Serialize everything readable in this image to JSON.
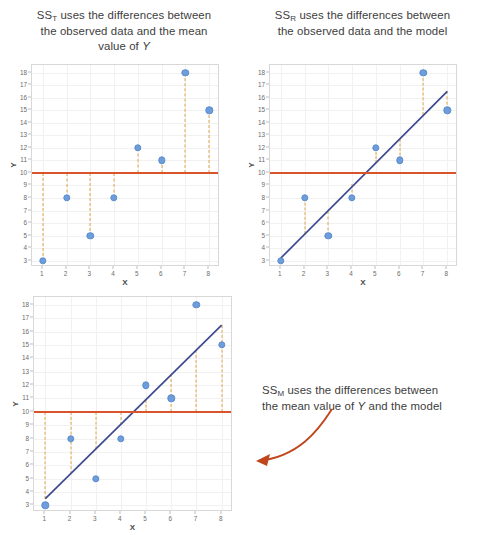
{
  "figure": {
    "title_t_prefix": "SS",
    "title_t_sub": "T",
    "title_t_line1_rest": " uses the differences between",
    "title_t_line2": "the observed data and the mean",
    "title_t_line3_a": "value of ",
    "title_t_line3_y": "Y",
    "title_r_prefix": "SS",
    "title_r_sub": "R",
    "title_r_line1_rest": " uses the differences between",
    "title_r_line2": "the observed data and the model",
    "title_m_prefix": "SS",
    "title_m_sub": "M",
    "title_m_line1_rest": " uses the differences between",
    "title_m_line2_a": "the mean value of ",
    "title_m_line2_y": "Y",
    "title_m_line2_b": " and the model"
  },
  "colors": {
    "point": "#6d9ddb",
    "mean_line": "#d9542b",
    "dashed": "#e0a44b",
    "model_line": "#3d4a8f",
    "arrow": "#c0461d",
    "grid": "#f1f1f1",
    "axis_text": "#6b6b6b"
  },
  "chart_data": [
    {
      "type": "scatter",
      "id": "ss-total",
      "title": "SS_T uses the differences between the observed data and the mean value of Y",
      "xlabel": "X",
      "ylabel": "Y",
      "x": [
        1,
        2,
        3,
        4,
        5,
        6,
        7,
        8
      ],
      "values": [
        3,
        8,
        5,
        8,
        12,
        11,
        18,
        15
      ],
      "xlim": [
        0.55,
        8.45
      ],
      "ylim": [
        2.5,
        18.6
      ],
      "xticks": [
        1,
        2,
        3,
        4,
        5,
        6,
        7,
        8
      ],
      "yticks": [
        3,
        4,
        5,
        6,
        7,
        8,
        9,
        10,
        11,
        12,
        13,
        14,
        15,
        16,
        17,
        18
      ],
      "grid": true,
      "legend": "none",
      "mean_line": 10,
      "model_line": null,
      "residual_type": "point-to-mean",
      "dashed_segments": [
        {
          "x": 1,
          "y1": 10,
          "y2": 3
        },
        {
          "x": 2,
          "y1": 10,
          "y2": 8
        },
        {
          "x": 3,
          "y1": 10,
          "y2": 5
        },
        {
          "x": 4,
          "y1": 10,
          "y2": 8
        },
        {
          "x": 5,
          "y1": 10,
          "y2": 12
        },
        {
          "x": 6,
          "y1": 10,
          "y2": 11
        },
        {
          "x": 7,
          "y1": 10,
          "y2": 18
        },
        {
          "x": 8,
          "y1": 10,
          "y2": 15
        }
      ]
    },
    {
      "type": "scatter",
      "id": "ss-residual",
      "title": "SS_R uses the differences between the observed data and the model",
      "xlabel": "X",
      "ylabel": "Y",
      "x": [
        1,
        2,
        3,
        4,
        5,
        6,
        7,
        8
      ],
      "values": [
        3,
        8,
        5,
        8,
        12,
        11,
        18,
        15
      ],
      "xlim": [
        0.55,
        8.45
      ],
      "ylim": [
        2.5,
        18.6
      ],
      "xticks": [
        1,
        2,
        3,
        4,
        5,
        6,
        7,
        8
      ],
      "yticks": [
        3,
        4,
        5,
        6,
        7,
        8,
        9,
        10,
        11,
        12,
        13,
        14,
        15,
        16,
        17,
        18
      ],
      "grid": true,
      "legend": "none",
      "mean_line": 10,
      "model_line": {
        "x1": 1,
        "y1": 3.2,
        "x2": 8,
        "y2": 16.5
      },
      "residual_type": "point-to-model",
      "dashed_segments": [
        {
          "x": 2,
          "y1": 8,
          "y2": 5.1
        },
        {
          "x": 3,
          "y1": 5,
          "y2": 7.0
        },
        {
          "x": 4,
          "y1": 8,
          "y2": 9.1
        },
        {
          "x": 5,
          "y1": 12,
          "y2": 10.8
        },
        {
          "x": 6,
          "y1": 11,
          "y2": 12.7
        },
        {
          "x": 7,
          "y1": 18,
          "y2": 14.6
        },
        {
          "x": 8,
          "y1": 15,
          "y2": 16.5
        }
      ]
    },
    {
      "type": "scatter",
      "id": "ss-model",
      "title": "SS_M uses the differences between the mean value of Y and the model",
      "xlabel": "X",
      "ylabel": "Y",
      "x": [
        1,
        2,
        3,
        4,
        5,
        6,
        7,
        8
      ],
      "values": [
        3,
        8,
        5,
        8,
        12,
        11,
        18,
        15
      ],
      "xlim": [
        0.55,
        8.45
      ],
      "ylim": [
        2.5,
        18.6
      ],
      "xticks": [
        1,
        2,
        3,
        4,
        5,
        6,
        7,
        8
      ],
      "yticks": [
        3,
        4,
        5,
        6,
        7,
        8,
        9,
        10,
        11,
        12,
        13,
        14,
        15,
        16,
        17,
        18
      ],
      "grid": true,
      "legend": "none",
      "mean_line": 10,
      "model_line": {
        "x1": 1,
        "y1": 3.5,
        "x2": 8,
        "y2": 16.5
      },
      "residual_type": "mean-to-model",
      "dashed_segments": [
        {
          "x": 1,
          "y1": 10,
          "y2": 3.5
        },
        {
          "x": 2,
          "y1": 10,
          "y2": 5.35
        },
        {
          "x": 3,
          "y1": 10,
          "y2": 7.2
        },
        {
          "x": 4,
          "y1": 10,
          "y2": 9.05
        },
        {
          "x": 5,
          "y1": 10,
          "y2": 10.9
        },
        {
          "x": 6,
          "y1": 10,
          "y2": 12.8
        },
        {
          "x": 7,
          "y1": 10,
          "y2": 14.65
        },
        {
          "x": 8,
          "y1": 10,
          "y2": 16.5
        }
      ]
    }
  ]
}
